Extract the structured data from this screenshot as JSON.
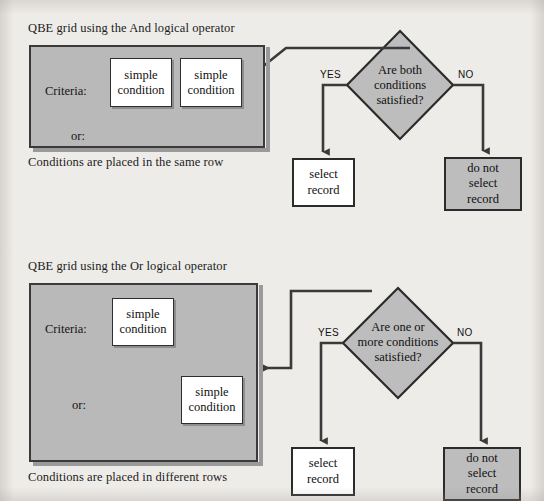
{
  "page": {
    "background_color": "#eeece8",
    "width": 544,
    "height": 501
  },
  "colors": {
    "grid_fill": "#b9b9b9",
    "node_gray_fill": "#bdbdbd",
    "node_white_fill": "#ffffff",
    "line": "#3a3a3a",
    "text": "#111111"
  },
  "diagrams": [
    {
      "id": "and-operator",
      "title": "QBE grid using the And logical operator",
      "caption": "Conditions are placed in the same row",
      "grid": {
        "criteria_label": "Criteria:",
        "or_label": "or:",
        "conditions": [
          {
            "line1": "simple",
            "line2": "condition",
            "row": "criteria"
          },
          {
            "line1": "simple",
            "line2": "condition",
            "row": "criteria"
          }
        ]
      },
      "decision": {
        "line1": "Are both",
        "line2": "conditions",
        "line3": "satisfied?"
      },
      "branches": {
        "yes_label": "YES",
        "no_label": "NO"
      },
      "outcomes": {
        "yes": {
          "line1": "select",
          "line2": "record",
          "line3": "",
          "fill": "white"
        },
        "no": {
          "line1": "do not",
          "line2": "select",
          "line3": "record",
          "fill": "gray"
        }
      }
    },
    {
      "id": "or-operator",
      "title": "QBE grid using the Or logical operator",
      "caption": "Conditions are placed in different rows",
      "grid": {
        "criteria_label": "Criteria:",
        "or_label": "or:",
        "conditions": [
          {
            "line1": "simple",
            "line2": "condition",
            "row": "criteria"
          },
          {
            "line1": "simple",
            "line2": "condition",
            "row": "or"
          }
        ]
      },
      "decision": {
        "line1": "Are one or",
        "line2": "more conditions",
        "line3": "satisfied?"
      },
      "branches": {
        "yes_label": "YES",
        "no_label": "NO"
      },
      "outcomes": {
        "yes": {
          "line1": "select",
          "line2": "record",
          "line3": "",
          "fill": "white"
        },
        "no": {
          "line1": "do not",
          "line2": "select",
          "line3": "record",
          "fill": "gray"
        }
      }
    }
  ]
}
